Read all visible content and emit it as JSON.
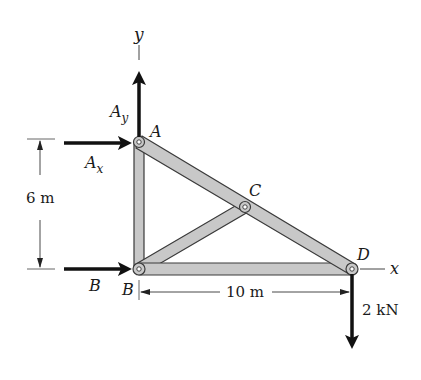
{
  "diagram": {
    "type": "truss free-body diagram",
    "axes": {
      "x_label": "x",
      "y_label": "y"
    },
    "joints": [
      {
        "id": "A",
        "label": "A"
      },
      {
        "id": "B",
        "label": "B"
      },
      {
        "id": "C",
        "label": "C"
      },
      {
        "id": "D",
        "label": "D"
      }
    ],
    "members": [
      "AB",
      "AD",
      "BC",
      "BD"
    ],
    "reactions": {
      "Ay": {
        "label_main": "A",
        "label_sub": "y",
        "direction": "up"
      },
      "Ax": {
        "label_main": "A",
        "label_sub": "x",
        "direction": "right"
      },
      "B": {
        "label": "B",
        "direction": "right"
      }
    },
    "loads": [
      {
        "at": "D",
        "label": "2 kN",
        "direction": "down"
      }
    ],
    "dimensions": {
      "vertical": "6 m",
      "horizontal": "10 m"
    },
    "colors": {
      "member_fill": "#c8c8c8",
      "member_stroke": "#3a3a3a",
      "arrow": "#111111",
      "dimension_line": "#333333"
    }
  }
}
